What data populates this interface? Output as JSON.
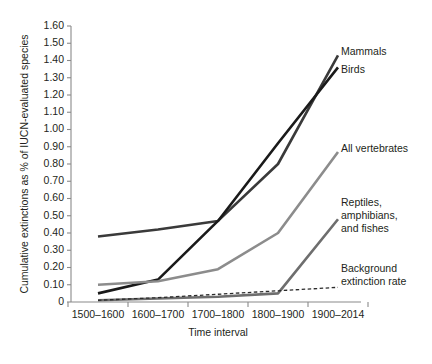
{
  "chart_data": {
    "type": "line",
    "title": "",
    "xlabel": "Time interval",
    "ylabel": "Cumulative extinctions as % of IUCN-evaluated species",
    "categories": [
      "1500–1600",
      "1600–1700",
      "1700–1800",
      "1800–1900",
      "1900–2014"
    ],
    "ylim": [
      0,
      1.6
    ],
    "ytick_labels": [
      "0",
      "0.10",
      "0.20",
      "0.30",
      "0.40",
      "0.50",
      "0.60",
      "0.70",
      "0.80",
      "0.90",
      "1.00",
      "1.10",
      "1.20",
      "1.30",
      "1.40",
      "1.50",
      "1.60"
    ],
    "ytick_values": [
      0,
      0.1,
      0.2,
      0.3,
      0.4,
      0.5,
      0.6,
      0.7,
      0.8,
      0.9,
      1.0,
      1.1,
      1.2,
      1.3,
      1.4,
      1.5,
      1.6
    ],
    "grid": false,
    "legend_position": "inline-annotations",
    "series": [
      {
        "name": "Mammals",
        "label": "Mammals",
        "color": "#3a3a3a",
        "style": "solid",
        "width": 2.6,
        "values": [
          0.38,
          0.42,
          0.47,
          0.8,
          1.43
        ]
      },
      {
        "name": "Birds",
        "label": "Birds",
        "color": "#1a1a1a",
        "style": "solid",
        "width": 2.6,
        "values": [
          0.05,
          0.13,
          0.47,
          0.92,
          1.36
        ]
      },
      {
        "name": "All vertebrates",
        "label": "All vertebrates",
        "color": "#8c8c8c",
        "style": "solid",
        "width": 2.6,
        "values": [
          0.1,
          0.12,
          0.19,
          0.4,
          0.87
        ]
      },
      {
        "name": "Reptiles, amphibians, and fishes",
        "label": "Reptiles,\namphibians,\nand fishes",
        "color": "#6e6e6e",
        "style": "solid",
        "width": 2.6,
        "values": [
          0.01,
          0.02,
          0.03,
          0.05,
          0.48
        ]
      },
      {
        "name": "Background extinction rate",
        "label": "Background\nextinction rate",
        "color": "#2b2b2b",
        "style": "dashed",
        "width": 1.3,
        "values": [
          0.01,
          0.025,
          0.045,
          0.065,
          0.085
        ]
      }
    ],
    "annotations": [
      {
        "text": "Mammals",
        "series": "Mammals"
      },
      {
        "text": "Birds",
        "series": "Birds"
      },
      {
        "text": "All vertebrates",
        "series": "All vertebrates"
      },
      {
        "text": "Reptiles,",
        "series": "Reptiles, amphibians, and fishes"
      },
      {
        "text": "amphibians,",
        "series": "Reptiles, amphibians, and fishes"
      },
      {
        "text": "and fishes",
        "series": "Reptiles, amphibians, and fishes"
      },
      {
        "text": "Background",
        "series": "Background extinction rate"
      },
      {
        "text": "extinction rate",
        "series": "Background extinction rate"
      }
    ]
  },
  "labels": {
    "y_axis_title": "Cumulative extinctions as % of IUCN-evaluated species",
    "x_axis_title": "Time interval",
    "ann_mammals": "Mammals",
    "ann_birds": "Birds",
    "ann_all_vertebrates": "All vertebrates",
    "ann_reptiles_1": "Reptiles,",
    "ann_reptiles_2": "amphibians,",
    "ann_reptiles_3": "and fishes",
    "ann_background_1": "Background",
    "ann_background_2": "extinction rate",
    "yt0": "0",
    "yt1": "0.10",
    "yt2": "0.20",
    "yt3": "0.30",
    "yt4": "0.40",
    "yt5": "0.50",
    "yt6": "0.60",
    "yt7": "0.70",
    "yt8": "0.80",
    "yt9": "0.90",
    "yt10": "1.00",
    "yt11": "1.10",
    "yt12": "1.20",
    "yt13": "1.30",
    "yt14": "1.40",
    "yt15": "1.50",
    "yt16": "1.60",
    "xt0": "1500–1600",
    "xt1": "1600–1700",
    "xt2": "1700–1800",
    "xt3": "1800–1900",
    "xt4": "1900–2014"
  }
}
